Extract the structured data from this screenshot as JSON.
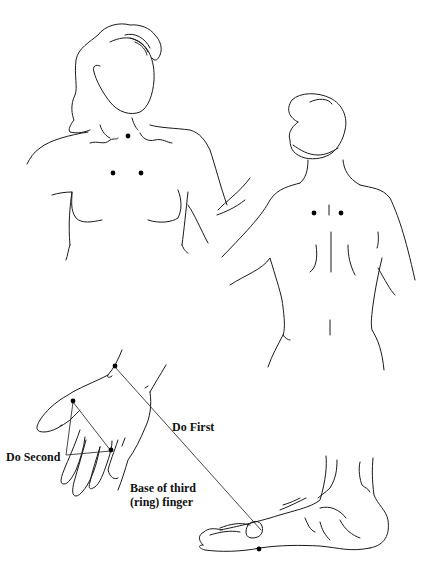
{
  "figure": {
    "type": "acupressure point illustration",
    "figures": [
      {
        "id": "front-torso",
        "description": "Woman, front view, head and chest",
        "points": 3
      },
      {
        "id": "back-torso",
        "description": "Woman, back view, head and upper back",
        "points": 2
      },
      {
        "id": "hand",
        "description": "Hand, back view, wrist and fingers",
        "points": 3
      },
      {
        "id": "foot",
        "description": "Foot, side view",
        "points": 1
      }
    ],
    "colors": {
      "line": "#1a1a1a",
      "point": "#000000",
      "background": "#ffffff"
    }
  },
  "labels": {
    "do_first": "Do First",
    "do_second": "Do Second",
    "base_line1": "Base of third",
    "base_line2": "(ring) finger"
  }
}
